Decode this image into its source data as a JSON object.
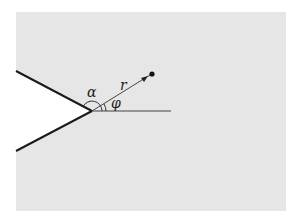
{
  "diagram": {
    "labels": {
      "alpha": "α",
      "r": "r",
      "phi": "φ"
    },
    "colors": {
      "background": "#ffffff",
      "region": "#e6e6e6",
      "wedge_edge": "#1a1a1a",
      "ray": "#444444"
    }
  }
}
